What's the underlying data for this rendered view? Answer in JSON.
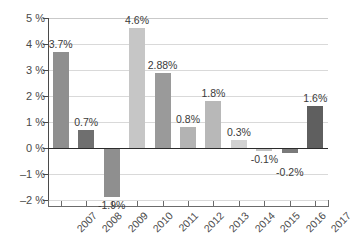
{
  "chart_data": {
    "type": "bar",
    "title": "",
    "subtitle": "",
    "xlabel": "",
    "ylabel": "",
    "grid": true,
    "legend": "none",
    "categories": [
      "2007",
      "2008",
      "2009",
      "2010",
      "2011",
      "2012",
      "2013",
      "2014",
      "2015",
      "2016",
      "2017"
    ],
    "values": [
      3.7,
      0.7,
      -1.9,
      4.6,
      2.88,
      0.8,
      1.8,
      0.3,
      -0.1,
      -0.2,
      1.6
    ],
    "value_labels": [
      "3.7%",
      "0.7%",
      "-1.9%",
      "4.6%",
      "2.88%",
      "0.8%",
      "1.8%",
      "0.3%",
      "-0.1%",
      "-0.2%",
      "1.6%"
    ],
    "bar_colors": [
      "#8f8f8f",
      "#6f6f6f",
      "#8f8f8f",
      "#c6c6c6",
      "#9a9a9a",
      "#b3b3b3",
      "#b8b8b8",
      "#d2d2d2",
      "#c2c2c2",
      "#7a7a7a",
      "#5f5f5f"
    ],
    "ylim": [
      -2,
      5
    ],
    "ytick_values": [
      5,
      4,
      3,
      2,
      1,
      0,
      -1,
      -2
    ],
    "ytick_labels": [
      "5 %",
      "4 %",
      "3 %",
      "2 %",
      "1 %",
      "0 %",
      "–1 %",
      "–2 %"
    ],
    "axis_color": "#4a4a4a",
    "gridline_color": "#d9d9d9",
    "zero_line_color": "#2b2b2b",
    "background_color": "#ffffff"
  }
}
